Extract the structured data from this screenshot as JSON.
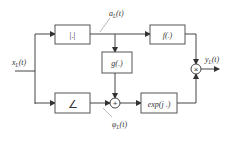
{
  "diagram": {
    "input_label": "x",
    "input_sub": "L",
    "input_arg": "(t)",
    "output_label": "y",
    "output_sub": "L",
    "output_arg": "(t)",
    "amplitude_label": "a",
    "amplitude_sub": "L",
    "amplitude_arg": "(t)",
    "phase_label": "φ",
    "phase_sub": "L",
    "phase_arg": "(t)",
    "blocks": {
      "abs": "|.|",
      "angle": "∠",
      "f": "f(.)",
      "g": "g(.)",
      "exp": "exp(j .)"
    },
    "sum_symbol": "+",
    "mult_symbol": "×",
    "colors": {
      "line": "#444444",
      "box": "#555555",
      "text": "#333333"
    }
  }
}
